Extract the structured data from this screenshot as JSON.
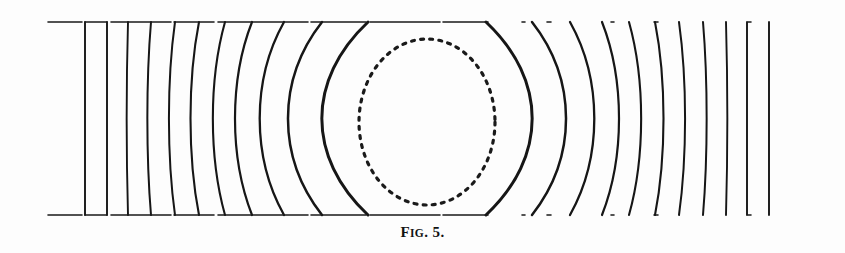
{
  "figure": {
    "caption_prefix": "F",
    "caption_smallcaps": "IG",
    "caption_suffix": ". 5.",
    "caption_full": "FIG. 5.",
    "background_color": "#fdfdfd",
    "ink_color": "#1a1a1a",
    "width": 845,
    "height": 253
  },
  "diagram": {
    "type": "field-line-diagram",
    "plates": {
      "stroke_width": 1.6,
      "x_start": 48,
      "x_end": 805,
      "top_y": 22,
      "bottom_y": 215,
      "dash_pattern": "34 3 22 4 60 3 40 4 90 3 55 4 70 3 45"
    },
    "cavity": {
      "shape": "ellipse",
      "cx": 427,
      "cy": 122,
      "rx": 68,
      "ry": 83,
      "stroke_width": 3.2,
      "dash_pattern": "3 6.2",
      "style": "dotted"
    },
    "symmetry_axis_x": 427,
    "flux_lines": [
      {
        "id": "L1",
        "x_top": 85,
        "x_mid": 85,
        "x_bot": 85,
        "bulge": 0,
        "stroke_width": 1.9
      },
      {
        "id": "L2",
        "x_top": 107,
        "x_mid": 107,
        "x_bot": 107,
        "bulge": -1,
        "stroke_width": 1.9
      },
      {
        "id": "L3",
        "x_top": 128,
        "x_mid": 127,
        "x_bot": 128,
        "bulge": -2,
        "stroke_width": 1.9
      },
      {
        "id": "L4",
        "x_top": 151,
        "x_mid": 148,
        "x_bot": 151,
        "bulge": -4,
        "stroke_width": 2.0
      },
      {
        "id": "L5",
        "x_top": 175,
        "x_mid": 170,
        "x_bot": 175,
        "bulge": -7,
        "stroke_width": 2.0
      },
      {
        "id": "L6",
        "x_top": 199,
        "x_mid": 192,
        "x_bot": 199,
        "bulge": -10,
        "stroke_width": 2.1
      },
      {
        "id": "L7",
        "x_top": 225,
        "x_mid": 215,
        "x_bot": 225,
        "bulge": -14,
        "stroke_width": 2.1
      },
      {
        "id": "L8",
        "x_top": 252,
        "x_mid": 238,
        "x_bot": 252,
        "bulge": -19,
        "stroke_width": 2.2
      },
      {
        "id": "L9",
        "x_top": 284,
        "x_mid": 264,
        "x_bot": 284,
        "bulge": -27,
        "stroke_width": 2.3
      },
      {
        "id": "L10",
        "x_top": 322,
        "x_mid": 294,
        "x_bot": 322,
        "bulge": -38,
        "stroke_width": 2.5
      },
      {
        "id": "L11",
        "x_top": 368,
        "x_mid": 330,
        "x_bot": 368,
        "bulge": -52,
        "stroke_width": 3.0
      },
      {
        "id": "R11",
        "x_top": 486,
        "x_mid": 524,
        "x_bot": 486,
        "bulge": 52,
        "stroke_width": 3.0
      },
      {
        "id": "R10",
        "x_top": 532,
        "x_mid": 560,
        "x_bot": 532,
        "bulge": 38,
        "stroke_width": 2.5
      },
      {
        "id": "R9",
        "x_top": 570,
        "x_mid": 590,
        "x_bot": 570,
        "bulge": 27,
        "stroke_width": 2.3
      },
      {
        "id": "R8",
        "x_top": 602,
        "x_mid": 616,
        "x_bot": 602,
        "bulge": 19,
        "stroke_width": 2.2
      },
      {
        "id": "R7",
        "x_top": 629,
        "x_mid": 639,
        "x_bot": 629,
        "bulge": 14,
        "stroke_width": 2.1
      },
      {
        "id": "R6",
        "x_top": 655,
        "x_mid": 662,
        "x_bot": 655,
        "bulge": 10,
        "stroke_width": 2.1
      },
      {
        "id": "R5",
        "x_top": 679,
        "x_mid": 684,
        "x_bot": 679,
        "bulge": 7,
        "stroke_width": 2.0
      },
      {
        "id": "R4",
        "x_top": 703,
        "x_mid": 706,
        "x_bot": 703,
        "bulge": 4,
        "stroke_width": 2.0
      },
      {
        "id": "R3",
        "x_top": 726,
        "x_mid": 727,
        "x_bot": 726,
        "bulge": 2,
        "stroke_width": 1.9
      },
      {
        "id": "R2",
        "x_top": 747,
        "x_mid": 747,
        "x_bot": 747,
        "bulge": 1,
        "stroke_width": 1.9
      },
      {
        "id": "R1",
        "x_top": 769,
        "x_mid": 769,
        "x_bot": 769,
        "bulge": 0,
        "stroke_width": 1.9
      }
    ]
  }
}
